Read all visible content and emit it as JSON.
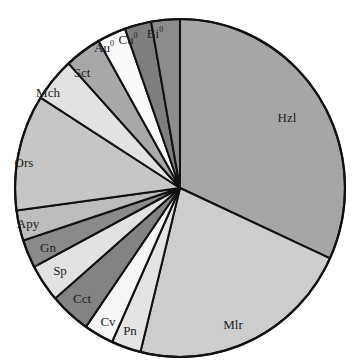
{
  "chart_data": {
    "type": "pie",
    "title": "",
    "start_angle_deg": 0,
    "direction": "clockwise",
    "unit": "percent (estimated from slice angles)",
    "slices": [
      {
        "label": "Hzl",
        "value": 31.8,
        "color": "#a6a6a6",
        "lx": 287,
        "ly": 122
      },
      {
        "label": "Mlr",
        "value": 22.0,
        "color": "#cdcdcd",
        "lx": 233,
        "ly": 329
      },
      {
        "label": "Pn",
        "value": 2.9,
        "color": "#e4e4e4",
        "lx": 130,
        "ly": 335
      },
      {
        "label": "Cv",
        "value": 2.9,
        "color": "#f6f6f6",
        "lx": 108,
        "ly": 326
      },
      {
        "label": "Cct",
        "value": 4.0,
        "color": "#838383",
        "lx": 82,
        "ly": 303
      },
      {
        "label": "Sp",
        "value": 3.6,
        "color": "#e2e2e2",
        "lx": 60,
        "ly": 275
      },
      {
        "label": "Gn",
        "value": 2.7,
        "color": "#8a8a8a",
        "lx": 48,
        "ly": 252
      },
      {
        "label": "Apy",
        "value": 2.9,
        "color": "#bdbdbd",
        "lx": 28,
        "ly": 228
      },
      {
        "label": "Ors",
        "value": 11.1,
        "color": "#c6c6c6",
        "lx": 24,
        "ly": 167
      },
      {
        "label": "Mch",
        "value": 4.2,
        "color": "#e2e2e2",
        "lx": 48,
        "ly": 97
      },
      {
        "label": "Sct",
        "value": 3.6,
        "color": "#a8a8a8",
        "lx": 82,
        "ly": 77
      },
      {
        "label": "Au",
        "value": 2.8,
        "color": "#fafafa",
        "lx": 104,
        "ly": 52,
        "sup": "0"
      },
      {
        "label": "Cu",
        "value": 2.6,
        "color": "#7e7e7e",
        "lx": 128,
        "ly": 44,
        "sup": "0"
      },
      {
        "label": "Bi",
        "value": 2.8,
        "color": "#8c8c8c",
        "lx": 155,
        "ly": 38,
        "sup": "0"
      }
    ],
    "legend": "none (labels inside slices)"
  }
}
